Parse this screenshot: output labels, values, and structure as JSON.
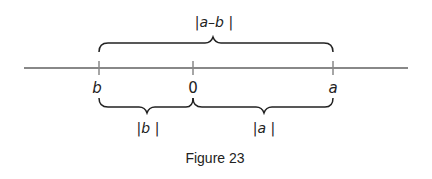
{
  "figure": {
    "caption": "Figure 23",
    "number_line": {
      "points": [
        {
          "label": "b",
          "x": 99
        },
        {
          "label": "0",
          "x": 193
        },
        {
          "label": "a",
          "x": 333
        }
      ]
    },
    "braces": {
      "top": {
        "label": "|a–b |",
        "from": "b",
        "to": "a"
      },
      "bottom_left": {
        "label": "|b |",
        "from": "b",
        "to": "0"
      },
      "bottom_right": {
        "label": "|a |",
        "from": "0",
        "to": "a"
      }
    }
  }
}
